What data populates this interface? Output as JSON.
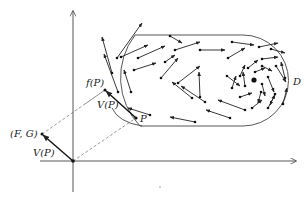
{
  "figure": {
    "type": "vector-field-diagram",
    "width": 307,
    "height": 199
  },
  "labels": {
    "region": "D",
    "fP": "f(P)",
    "VP_upper": "V(P)",
    "P": "P",
    "FG": "(F, G)",
    "VP_lower": "V(P)"
  },
  "colors": {
    "ink": "#222222",
    "background": "#ffffff"
  },
  "geometry": {
    "origin": [
      73,
      161
    ],
    "y_axis": {
      "x": 73,
      "y_top": 10,
      "y_bottom": 192
    },
    "x_axis": {
      "y": 161,
      "x_left": 40,
      "x_right": 296
    },
    "point_P": [
      136,
      118
    ],
    "point_fP": [
      105,
      90
    ],
    "point_FG": [
      42,
      134
    ],
    "vortex_center": [
      254,
      80
    ]
  }
}
